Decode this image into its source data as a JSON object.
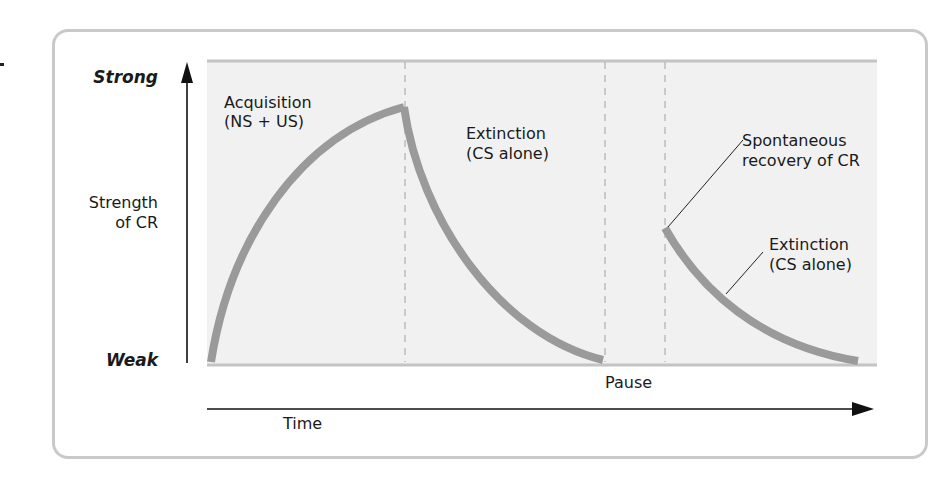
{
  "figure": {
    "y_axis": {
      "label_line1": "Strength",
      "label_line2": "of CR",
      "top_label": "Strong",
      "bottom_label": "Weak"
    },
    "x_axis": {
      "label": "Time",
      "gap_label": "Pause"
    },
    "annotations": {
      "acquisition_line1": "Acquisition",
      "acquisition_line2": "(NS + US)",
      "extinction1_line1": "Extinction",
      "extinction1_line2": "(CS alone)",
      "recovery_line1": "Spontaneous",
      "recovery_line2": "recovery of CR",
      "extinction2_line1": "Extinction",
      "extinction2_line2": "(CS alone)"
    },
    "colors": {
      "plot_background": "#f1f1f1",
      "curve": "#9a9a9a",
      "frame": "#c9c9c9",
      "axis": "#111111",
      "dashed_divider": "#b0b0b0"
    },
    "phases": [
      {
        "name": "Acquisition (NS + US)",
        "start_strength": "Weak",
        "end_strength": "Strong"
      },
      {
        "name": "Extinction (CS alone)",
        "start_strength": "Strong",
        "end_strength": "Weak"
      },
      {
        "name": "Pause",
        "start_strength": null,
        "end_strength": null
      },
      {
        "name": "Spontaneous recovery of CR / Extinction (CS alone)",
        "start_strength": "Moderate",
        "end_strength": "Weak"
      }
    ]
  }
}
